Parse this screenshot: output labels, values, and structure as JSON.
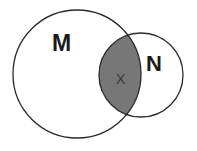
{
  "diagram": {
    "type": "venn",
    "sets": [
      {
        "id": "M",
        "label": "M",
        "cx": 77,
        "cy": 74,
        "r": 64
      },
      {
        "id": "N",
        "label": "N",
        "cx": 141,
        "cy": 75,
        "r": 42
      }
    ],
    "intersection": {
      "label": "X",
      "shaded": true,
      "fill": "#777777"
    },
    "stroke": "#2a2a2a",
    "background": "#ffffff"
  }
}
